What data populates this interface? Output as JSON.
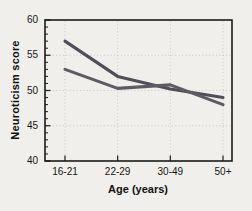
{
  "figure": {
    "background_color": "#f0efeb",
    "axis_color": "#1b1b1b",
    "grid_color": "#c9c8c2"
  },
  "chart_data": {
    "type": "line",
    "title": "",
    "xlabel": "Age (years)",
    "ylabel": "Neuroticism score",
    "categories": [
      "16-21",
      "22-29",
      "30-49",
      "50+"
    ],
    "y_ticks": [
      40,
      45,
      50,
      55,
      60
    ],
    "ylim": [
      40,
      60
    ],
    "y_minor_step": 1,
    "grid": {
      "style": "dotted",
      "horizontal_at": [
        45,
        50,
        55
      ],
      "vertical_at_categories": true
    },
    "legend": "none",
    "series": [
      {
        "name": "line-1",
        "color": "#504e58",
        "values": [
          57,
          52,
          50.2,
          49
        ]
      },
      {
        "name": "line-2",
        "color": "#5e5b62",
        "values": [
          53,
          50.3,
          50.8,
          48
        ]
      }
    ]
  }
}
